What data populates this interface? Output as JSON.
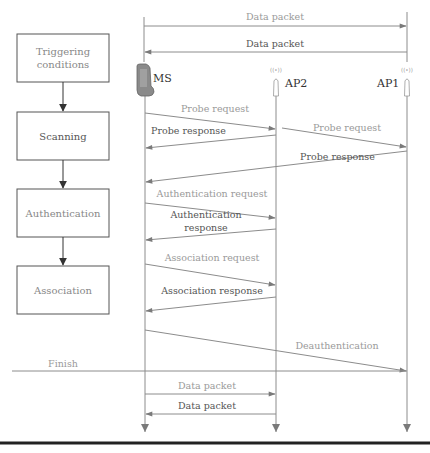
{
  "diagram": {
    "type": "sequence-diagram",
    "phases": [
      {
        "label_line1": "Triggering",
        "label_line2": "conditions"
      },
      {
        "label": "Scanning"
      },
      {
        "label": "Authentication"
      },
      {
        "label": "Association"
      }
    ],
    "nodes": {
      "ms": "MS",
      "ap2": "AP2",
      "ap1": "AP1"
    },
    "messages": {
      "data_top_1": "Data packet",
      "data_top_2": "Data packet",
      "probe_req_1": "Probe request",
      "probe_resp_1": "Probe response",
      "probe_req_2": "Probe request",
      "probe_resp_2": "Probe response",
      "auth_req": "Authentication request",
      "auth_resp_line1": "Authentication",
      "auth_resp_line2": "response",
      "assoc_req": "Association request",
      "assoc_resp": "Association response",
      "deauth": "Deauthentication",
      "finish": "Finish",
      "data_bot_1": "Data packet",
      "data_bot_2": "Data packet"
    },
    "colors": {
      "line": "#8c8c8c",
      "arrow": "#7a7a7a",
      "text_light": "#9a9a9a",
      "text_dark": "#555555",
      "bottom_rule": "#222222"
    }
  }
}
